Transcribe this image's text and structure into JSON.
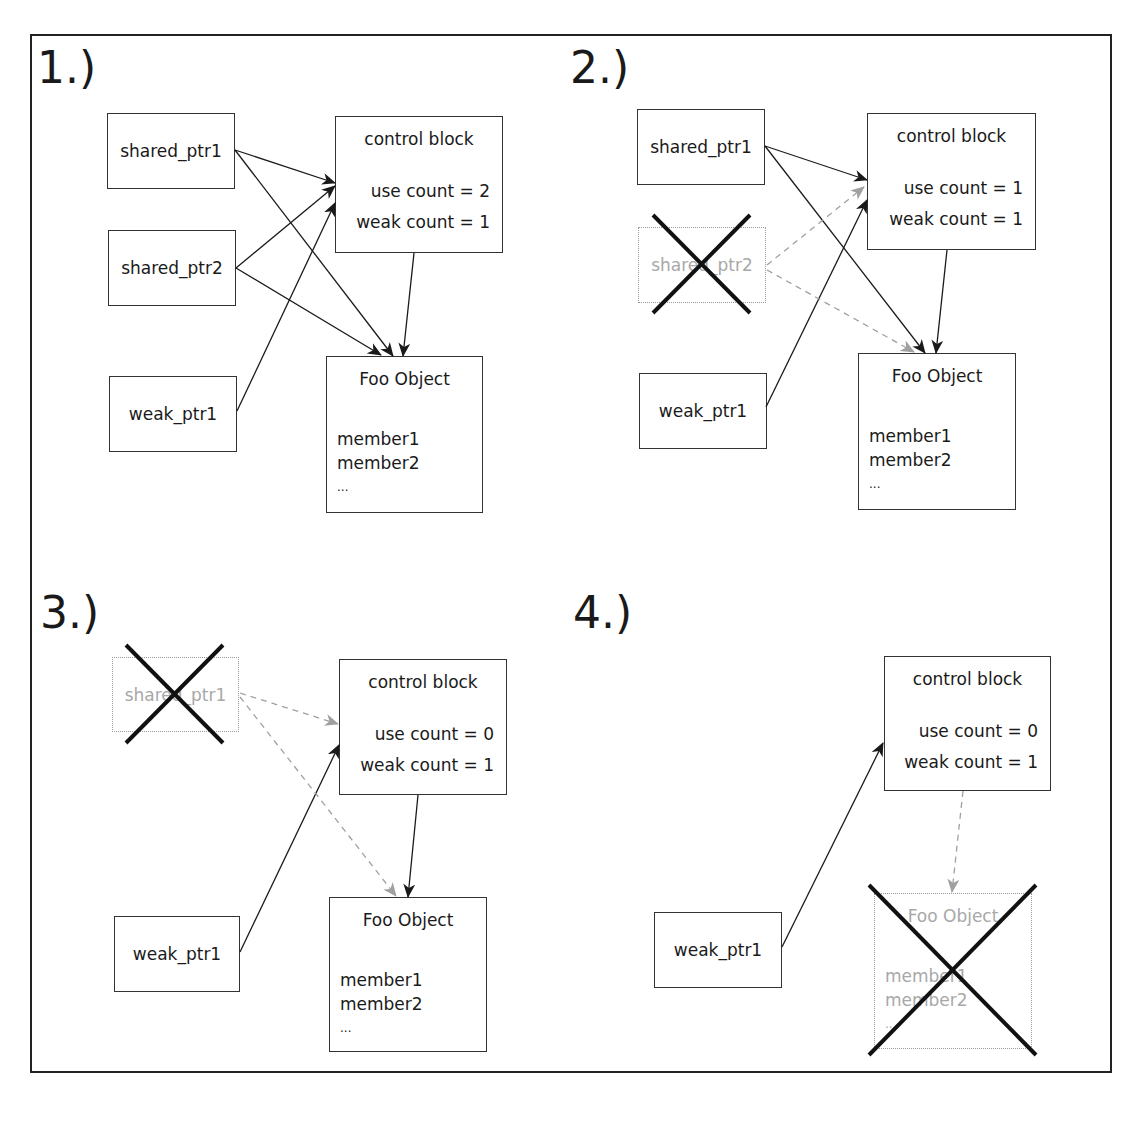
{
  "diagram": {
    "panels": [
      {
        "label": "1.)",
        "shared_ptr1": "shared_ptr1",
        "shared_ptr2": "shared_ptr2",
        "weak_ptr1": "weak_ptr1",
        "control_block": {
          "title": "control block",
          "use_count": "use count = 2",
          "weak_count": "weak count = 1"
        },
        "foo": {
          "title": "Foo Object",
          "member1": "member1",
          "member2": "member2",
          "ellipsis": "..."
        }
      },
      {
        "label": "2.)",
        "shared_ptr1": "shared_ptr1",
        "shared_ptr2": "shared_ptr2",
        "weak_ptr1": "weak_ptr1",
        "control_block": {
          "title": "control block",
          "use_count": "use count = 1",
          "weak_count": "weak count = 1"
        },
        "foo": {
          "title": "Foo Object",
          "member1": "member1",
          "member2": "member2",
          "ellipsis": "..."
        }
      },
      {
        "label": "3.)",
        "shared_ptr1": "shared_ptr1",
        "weak_ptr1": "weak_ptr1",
        "control_block": {
          "title": "control block",
          "use_count": "use count = 0",
          "weak_count": "weak count = 1"
        },
        "foo": {
          "title": "Foo Object",
          "member1": "member1",
          "member2": "member2",
          "ellipsis": "..."
        }
      },
      {
        "label": "4.)",
        "weak_ptr1": "weak_ptr1",
        "control_block": {
          "title": "control block",
          "use_count": "use count = 0",
          "weak_count": "weak count = 1"
        },
        "foo": {
          "title": "Foo Object",
          "member1": "member1",
          "member2": "member2",
          "ellipsis": "..."
        }
      }
    ],
    "colors": {
      "line": "#1a1a1a",
      "faded": "#a0a0a0",
      "cross": "#111111"
    }
  }
}
